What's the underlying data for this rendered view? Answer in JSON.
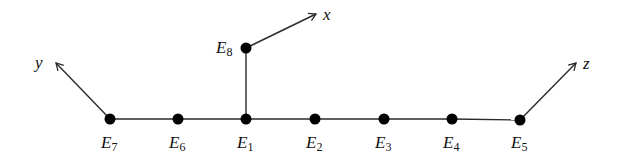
{
  "diagram": {
    "type": "dynkin-diagram",
    "nodes": [
      {
        "id": "E7",
        "label": "E",
        "sub": "7",
        "x": 110,
        "y": 119
      },
      {
        "id": "E6",
        "label": "E",
        "sub": "6",
        "x": 178,
        "y": 119
      },
      {
        "id": "E1",
        "label": "E",
        "sub": "1",
        "x": 246,
        "y": 119
      },
      {
        "id": "E2",
        "label": "E",
        "sub": "2",
        "x": 315,
        "y": 119
      },
      {
        "id": "E3",
        "label": "E",
        "sub": "3",
        "x": 384,
        "y": 119
      },
      {
        "id": "E4",
        "label": "E",
        "sub": "4",
        "x": 452,
        "y": 119
      },
      {
        "id": "E5",
        "label": "E",
        "sub": "5",
        "x": 520,
        "y": 120
      },
      {
        "id": "E8",
        "label": "E",
        "sub": "8",
        "x": 246,
        "y": 48
      }
    ],
    "edges": [
      [
        "E7",
        "E6"
      ],
      [
        "E6",
        "E1"
      ],
      [
        "E1",
        "E2"
      ],
      [
        "E2",
        "E3"
      ],
      [
        "E3",
        "E4"
      ],
      [
        "E4",
        "E5"
      ],
      [
        "E1",
        "E8"
      ]
    ],
    "arrows": [
      {
        "from": "E8",
        "label": "x",
        "to_x": 316,
        "to_y": 14
      },
      {
        "from": "E7",
        "label": "y",
        "to_x": 56,
        "to_y": 63
      },
      {
        "from": "E5",
        "label": "z",
        "to_x": 576,
        "to_y": 63
      }
    ]
  },
  "labels": {
    "E7": {
      "main": "E",
      "sub": "7"
    },
    "E6": {
      "main": "E",
      "sub": "6"
    },
    "E1": {
      "main": "E",
      "sub": "1"
    },
    "E2": {
      "main": "E",
      "sub": "2"
    },
    "E3": {
      "main": "E",
      "sub": "3"
    },
    "E4": {
      "main": "E",
      "sub": "4"
    },
    "E5": {
      "main": "E",
      "sub": "5"
    },
    "E8": {
      "main": "E",
      "sub": "8"
    },
    "x": "x",
    "y": "y",
    "z": "z"
  }
}
